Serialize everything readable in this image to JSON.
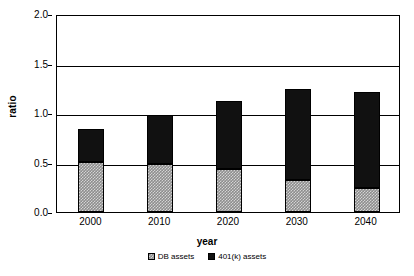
{
  "chart_data": {
    "type": "bar",
    "stacked": true,
    "title": "",
    "xlabel": "year",
    "ylabel": "ratio",
    "categories": [
      "2000",
      "2010",
      "2020",
      "2030",
      "2040"
    ],
    "ylim": [
      0.0,
      2.0
    ],
    "yticks": [
      "0.0",
      "0.5",
      "1.0",
      "1.5",
      "2.0"
    ],
    "ytick_values": [
      0.0,
      0.5,
      1.0,
      1.5,
      2.0
    ],
    "grid": true,
    "legend_position": "bottom",
    "series": [
      {
        "name": "DB assets",
        "color": "#8d8d8d",
        "pattern": "checkered",
        "values": [
          0.51,
          0.49,
          0.43,
          0.32,
          0.24
        ]
      },
      {
        "name": "401(k) assets",
        "color": "#111111",
        "pattern": "solid",
        "values": [
          0.33,
          0.49,
          0.69,
          0.92,
          0.97
        ]
      }
    ],
    "totals": [
      0.84,
      0.98,
      1.12,
      1.24,
      1.21
    ]
  }
}
